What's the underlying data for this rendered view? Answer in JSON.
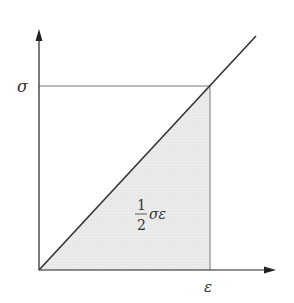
{
  "diagram": {
    "y_axis_label": "σ",
    "x_axis_label": "ε",
    "area_label": {
      "numerator": "1",
      "denominator": "2",
      "expression": "σε"
    },
    "colors": {
      "axis": "#222222",
      "line": "#333333",
      "guide": "#777777",
      "fill": "#e6e6e6"
    }
  }
}
